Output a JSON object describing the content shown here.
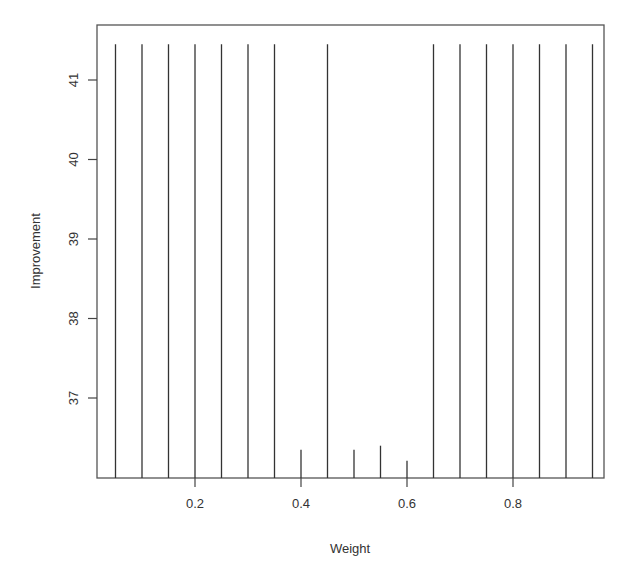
{
  "chart_data": {
    "type": "bar",
    "subtype": "vertical-lines (R type='h')",
    "title": "",
    "xlabel": "Weight",
    "ylabel": "Improvement",
    "x": [
      0.05,
      0.1,
      0.15,
      0.2,
      0.25,
      0.3,
      0.35,
      0.4,
      0.45,
      0.5,
      0.55,
      0.6,
      0.65,
      0.7,
      0.75,
      0.8,
      0.85,
      0.9,
      0.95
    ],
    "values": [
      41.45,
      41.45,
      41.45,
      41.45,
      41.45,
      41.45,
      41.45,
      36.35,
      41.45,
      36.35,
      36.4,
      36.21,
      41.45,
      41.45,
      41.45,
      41.45,
      41.45,
      41.45,
      41.45
    ],
    "xticks": [
      "0.2",
      "0.4",
      "0.6",
      "0.8"
    ],
    "xtick_values": [
      0.2,
      0.4,
      0.6,
      0.8
    ],
    "yticks": [
      "37",
      "38",
      "39",
      "40",
      "41"
    ],
    "ytick_values": [
      37,
      38,
      39,
      40,
      41
    ],
    "xlim": [
      0.012,
      0.968
    ],
    "ylim": [
      36.0,
      41.69
    ],
    "baseline": 36.0,
    "grid": false,
    "legend": null,
    "colors": {
      "line": "#333333",
      "axis": "#444444",
      "text": "#333333",
      "background": "#ffffff"
    }
  }
}
